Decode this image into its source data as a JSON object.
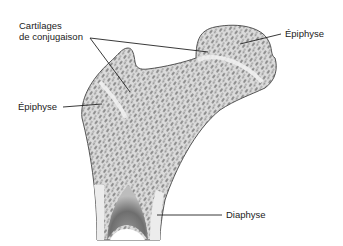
{
  "diagram": {
    "labels": {
      "cartilage_line1": "Cartilages",
      "cartilage_line2": "de conjugaison",
      "epiphyse_right": "Épiphyse",
      "epiphyse_left": "Épiphyse",
      "diaphyse": "Diaphyse"
    },
    "colors": {
      "background": "#ffffff",
      "bone_fill": "#d8d8d8",
      "bone_outline": "#555555",
      "pores": "#8a8a8a",
      "cartilage_band": "#ececec",
      "medullary_cavity": "#6a6a6a",
      "leader_lines": "#222222",
      "text": "#222222"
    }
  }
}
